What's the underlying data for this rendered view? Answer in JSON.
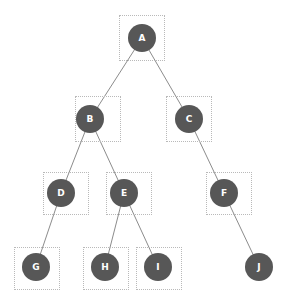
{
  "diagram": {
    "type": "tree",
    "background_color": "#ffffff",
    "node_color": "#575757",
    "node_label_color": "#ffffff",
    "edge_color": "#8c8c8c",
    "bbox_border_color": "#b9b9b9",
    "node_radius": 14,
    "edge_width": 1,
    "nodes": [
      {
        "id": "A",
        "label": "A",
        "cx": 142,
        "cy": 38,
        "r": 14,
        "bbox": {
          "x": 119,
          "y": 15,
          "w": 46,
          "h": 46
        },
        "has_bbox": true
      },
      {
        "id": "B",
        "label": "B",
        "cx": 90,
        "cy": 119,
        "r": 14,
        "bbox": {
          "x": 75,
          "y": 96,
          "w": 46,
          "h": 46
        },
        "has_bbox": true
      },
      {
        "id": "C",
        "label": "C",
        "cx": 189,
        "cy": 119,
        "r": 14,
        "bbox": {
          "x": 166,
          "y": 96,
          "w": 46,
          "h": 46
        },
        "has_bbox": true
      },
      {
        "id": "D",
        "label": "D",
        "cx": 61,
        "cy": 193,
        "r": 14,
        "bbox": {
          "x": 43,
          "y": 172,
          "w": 46,
          "h": 43
        },
        "has_bbox": true
      },
      {
        "id": "E",
        "label": "E",
        "cx": 124,
        "cy": 193,
        "r": 14,
        "bbox": {
          "x": 106,
          "y": 172,
          "w": 46,
          "h": 43
        },
        "has_bbox": true
      },
      {
        "id": "F",
        "label": "F",
        "cx": 224,
        "cy": 193,
        "r": 14,
        "bbox": {
          "x": 206,
          "y": 172,
          "w": 46,
          "h": 43
        },
        "has_bbox": true
      },
      {
        "id": "G",
        "label": "G",
        "cx": 36,
        "cy": 267,
        "r": 14,
        "bbox": {
          "x": 14,
          "y": 247,
          "w": 46,
          "h": 43
        },
        "has_bbox": true
      },
      {
        "id": "H",
        "label": "H",
        "cx": 105,
        "cy": 267,
        "r": 14,
        "bbox": {
          "x": 83,
          "y": 247,
          "w": 46,
          "h": 43
        },
        "has_bbox": true
      },
      {
        "id": "I",
        "label": "I",
        "cx": 158,
        "cy": 267,
        "r": 14,
        "bbox": {
          "x": 136,
          "y": 247,
          "w": 46,
          "h": 43
        },
        "has_bbox": true
      },
      {
        "id": "J",
        "label": "J",
        "cx": 259,
        "cy": 267,
        "r": 14,
        "bbox": null,
        "has_bbox": false
      }
    ],
    "edges": [
      {
        "id": "edge-a-b",
        "from": "A",
        "to": "B"
      },
      {
        "id": "edge-a-c",
        "from": "A",
        "to": "C"
      },
      {
        "id": "edge-b-d",
        "from": "B",
        "to": "D"
      },
      {
        "id": "edge-b-e",
        "from": "B",
        "to": "E"
      },
      {
        "id": "edge-c-f",
        "from": "C",
        "to": "F"
      },
      {
        "id": "edge-d-g",
        "from": "D",
        "to": "G"
      },
      {
        "id": "edge-e-h",
        "from": "E",
        "to": "H"
      },
      {
        "id": "edge-e-i",
        "from": "E",
        "to": "I"
      },
      {
        "id": "edge-f-j",
        "from": "F",
        "to": "J"
      }
    ]
  }
}
